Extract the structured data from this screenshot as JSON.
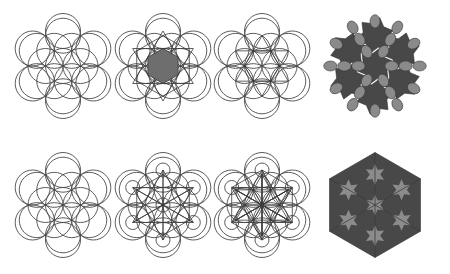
{
  "figure": {
    "background": "#ffffff",
    "colors": {
      "line": "#4a4a4a",
      "hexagon_fill": "#6e6e6e",
      "tile_dark": "#484848",
      "tile_light": "#8a8a8a",
      "star_fill": "#8c8c8c"
    },
    "radius": 17.5,
    "panels": [
      {
        "id": "a",
        "row": 1,
        "col": 1,
        "cx": 63,
        "cy": 66,
        "kind": "circle-grid"
      },
      {
        "id": "b",
        "row": 1,
        "col": 2,
        "cx": 163,
        "cy": 66,
        "kind": "circle-grid-hexagon-lines"
      },
      {
        "id": "c",
        "row": 1,
        "col": 3,
        "cx": 262,
        "cy": 66,
        "kind": "circle-grid-hexagon-outline"
      },
      {
        "id": "d",
        "row": 1,
        "col": 4,
        "cx": 375,
        "cy": 66,
        "kind": "tiling-petals"
      },
      {
        "id": "e",
        "row": 2,
        "col": 1,
        "cx": 63,
        "cy": 205,
        "kind": "circle-grid"
      },
      {
        "id": "f",
        "row": 2,
        "col": 2,
        "cx": 163,
        "cy": 205,
        "kind": "circle-grid-small-circles-lines"
      },
      {
        "id": "g",
        "row": 2,
        "col": 3,
        "cx": 262,
        "cy": 205,
        "kind": "circle-grid-dense-lines"
      },
      {
        "id": "h",
        "row": 2,
        "col": 4,
        "cx": 375,
        "cy": 205,
        "kind": "tiling-stars"
      }
    ]
  }
}
